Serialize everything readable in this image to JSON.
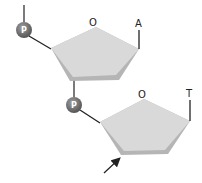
{
  "diagram": {
    "type": "dinucleotide-backbone",
    "nucleotides": [
      {
        "sugar_ring_oxygen_label": "O",
        "base_label": "A",
        "phosphate_label": "P"
      },
      {
        "sugar_ring_oxygen_label": "O",
        "base_label": "T",
        "phosphate_label": "P"
      }
    ],
    "colors": {
      "sugar_fill": "#d9d9d9",
      "sugar_shadow": "#b8b8b8",
      "phosphate_fill": "#6e6e6e",
      "line": "#222222"
    }
  }
}
